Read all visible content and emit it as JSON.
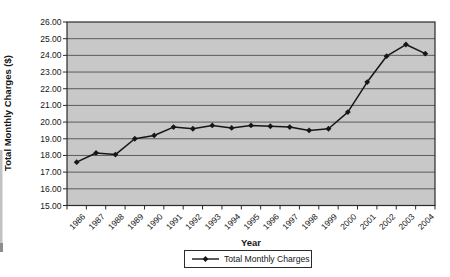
{
  "chart_data": {
    "type": "line",
    "title": "",
    "xlabel": "Year",
    "ylabel": "Total Monthly Charges ($)",
    "categories": [
      "1986",
      "1987",
      "1988",
      "1989",
      "1990",
      "1991",
      "1992",
      "1993",
      "1994",
      "1995",
      "1996",
      "1997",
      "1998",
      "1999",
      "2000",
      "2001",
      "2002",
      "2003",
      "2004"
    ],
    "series": [
      {
        "name": "Total Monthly Charges",
        "values": [
          17.6,
          18.15,
          18.05,
          19.0,
          19.2,
          19.7,
          19.6,
          19.8,
          19.65,
          19.8,
          19.75,
          19.7,
          19.5,
          19.6,
          20.6,
          22.4,
          23.95,
          24.65,
          24.1
        ]
      }
    ],
    "ylim": [
      15,
      26
    ],
    "ytick_step": 1,
    "ytick_labels": [
      "26.00",
      "25.00",
      "24.00",
      "23.00",
      "22.00",
      "21.00",
      "20.00",
      "19.00",
      "18.00",
      "17.00",
      "16.00",
      "15.00"
    ],
    "grid": "horizontal",
    "legend_position": "bottom",
    "marker": "diamond",
    "colors": {
      "plot_bg": "#c8c8c8",
      "grid": "#4f4f4f",
      "line": "#161616",
      "marker": "#161616",
      "border": "#2b2b2b",
      "text": "#161616",
      "legend_bg": "#ffffff"
    }
  },
  "legend": {
    "label": "Total Monthly Charges"
  }
}
